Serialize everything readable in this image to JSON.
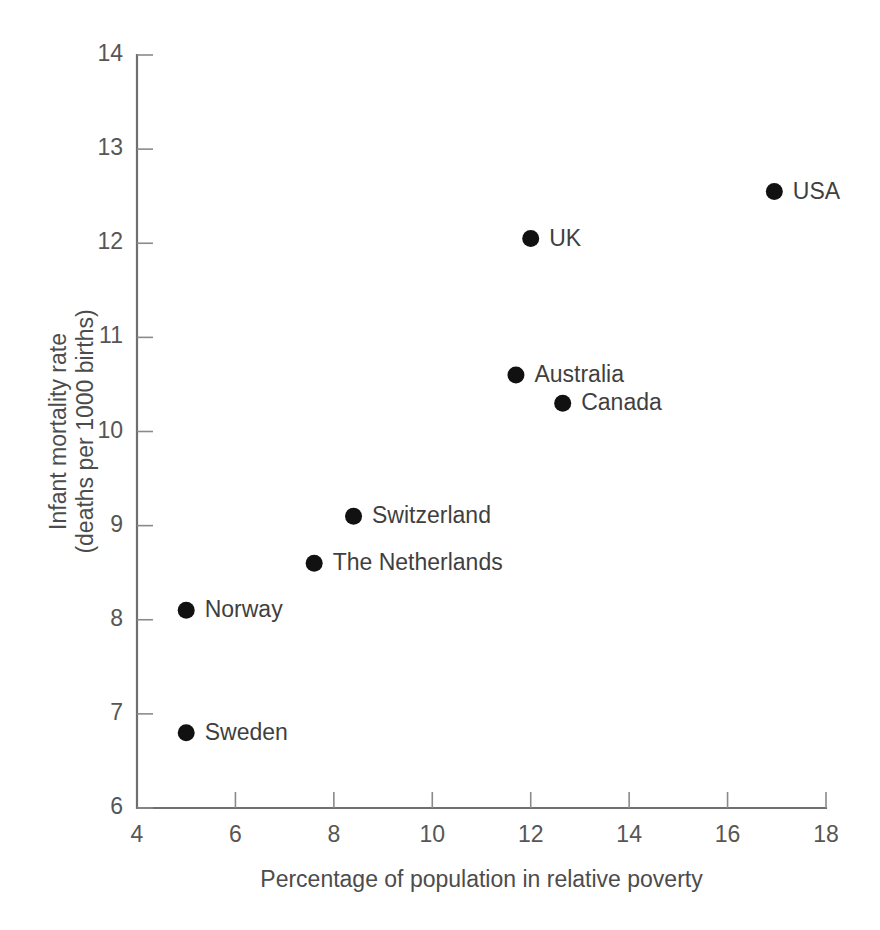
{
  "chart_data": {
    "type": "scatter",
    "title": "",
    "subtitle": "",
    "xlabel": "Percentage of population in relative poverty",
    "ylabel": "Infant mortality rate\n(deaths per 1000 births)",
    "ylabel_line1": "Infant mortality rate",
    "ylabel_line2": "(deaths per 1000 births)",
    "xlim": [
      4,
      18
    ],
    "ylim": [
      6,
      14
    ],
    "xticks": [
      4,
      6,
      8,
      10,
      12,
      14,
      16,
      18
    ],
    "xtick_labels": [
      "4",
      "6",
      "8",
      "10",
      "12",
      "14",
      "16",
      "18"
    ],
    "yticks": [
      6,
      7,
      8,
      9,
      10,
      11,
      12,
      13,
      14
    ],
    "ytick_labels": [
      "6",
      "7",
      "8",
      "9",
      "10",
      "11",
      "12",
      "13",
      "14"
    ],
    "grid": false,
    "legend": false,
    "legend_position": "none",
    "tick_direction": "in",
    "marker": "filled-circle",
    "marker_color": "#111111",
    "marker_size_px": 17,
    "axis_color": "#6f6f6f",
    "text_color": "#4c4c4c",
    "background_color": "#ffffff",
    "points": [
      {
        "label": "Sweden",
        "x": 5.0,
        "y": 6.8,
        "label_side": "right"
      },
      {
        "label": "Norway",
        "x": 5.0,
        "y": 8.1,
        "label_side": "right"
      },
      {
        "label": "The Netherlands",
        "x": 7.6,
        "y": 8.6,
        "label_side": "right"
      },
      {
        "label": "Switzerland",
        "x": 8.4,
        "y": 9.1,
        "label_side": "right"
      },
      {
        "label": "Australia",
        "x": 11.7,
        "y": 10.6,
        "label_side": "right"
      },
      {
        "label": "Canada",
        "x": 12.65,
        "y": 10.3,
        "label_side": "right"
      },
      {
        "label": "UK",
        "x": 12.0,
        "y": 12.05,
        "label_side": "right"
      },
      {
        "label": "USA",
        "x": 16.95,
        "y": 12.55,
        "label_side": "right"
      }
    ]
  }
}
